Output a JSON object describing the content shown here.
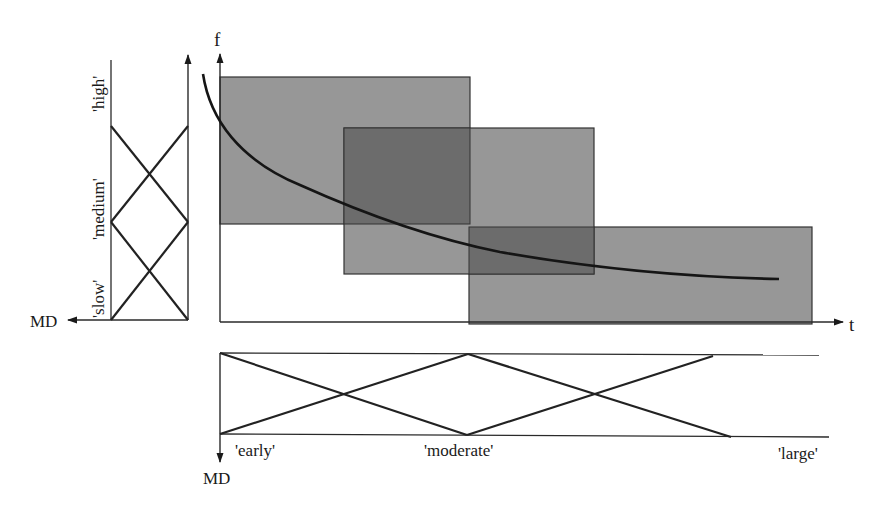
{
  "diagram": {
    "main_plot": {
      "y_axis_label": "f",
      "x_axis_label": "t",
      "regions": [
        {
          "name": "early-high",
          "x": [
            220,
            470
          ],
          "y": [
            77,
            224
          ]
        },
        {
          "name": "moderate-medium",
          "x": [
            344,
            594
          ],
          "y": [
            128,
            274
          ]
        },
        {
          "name": "large-slow",
          "x": [
            469,
            812
          ],
          "y": [
            227,
            324
          ]
        }
      ],
      "region_fill": "#979797",
      "overlap_fill": "#6c6c6c",
      "curve": "decreasing hyperbolic f(t)"
    },
    "left_membership": {
      "axis_label": "MD",
      "terms": [
        "'slow'",
        "'medium'",
        "'high'"
      ]
    },
    "bottom_membership": {
      "axis_label": "MD",
      "terms": [
        "'early'",
        "'moderate'",
        "'large'"
      ]
    }
  }
}
